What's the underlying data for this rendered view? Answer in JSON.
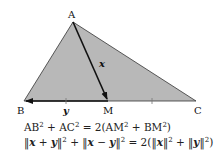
{
  "diagram": {
    "type": "triangle-median-vectors",
    "fill_color": "#b8b8b8",
    "stroke_color": "#222222",
    "vertices": {
      "A": {
        "label": "A",
        "x": 73,
        "y": 22
      },
      "B": {
        "label": "B",
        "x": 24,
        "y": 101
      },
      "M": {
        "label": "M",
        "x": 108,
        "y": 101
      },
      "C": {
        "label": "C",
        "x": 196,
        "y": 101
      }
    },
    "vectors": [
      {
        "name": "x",
        "label": "x",
        "from": "A",
        "to": "M"
      },
      {
        "name": "y",
        "label": "y",
        "from": "M",
        "to": "B"
      }
    ],
    "tick_marks": [
      "BM",
      "MC"
    ]
  },
  "formulas": {
    "line1": {
      "lhs_a": "AB",
      "exp_a": "2",
      "plus": " + ",
      "lhs_b": "AC",
      "exp_b": "2",
      "eq": " = 2(",
      "rhs_a": "AM",
      "exp_c": "2",
      "plus2": " + ",
      "rhs_b": "BM",
      "exp_d": "2",
      "close": ")"
    },
    "line2": {
      "open1": "‖",
      "x1": "x",
      "plus1": " + ",
      "y1": "y",
      "close1": "‖",
      "sq1": "2",
      "plus2": " + ",
      "open2": "‖",
      "x2": "x",
      "minus": " − ",
      "y2": "y",
      "close2": "‖",
      "sq2": "2",
      "eq": " = 2(",
      "open3": "‖",
      "x3": "x",
      "close3": "‖",
      "sq3": "2",
      "plus3": " + ",
      "open4": "‖",
      "y3": "y",
      "close4": "‖",
      "sq4": "2",
      "end": ")"
    }
  }
}
